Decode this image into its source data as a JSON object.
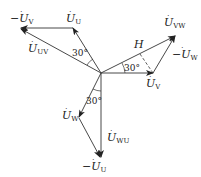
{
  "diagram": {
    "type": "phasor",
    "origin": [
      101,
      73
    ],
    "vectors": [
      {
        "id": "U_U",
        "label": "U",
        "sub": "U",
        "neg": false,
        "from": [
          101,
          73
        ],
        "to": [
          73,
          28
        ]
      },
      {
        "id": "neg_U_V",
        "label": "U",
        "sub": "V",
        "neg": true,
        "from": [
          73,
          28
        ],
        "to": [
          20,
          28
        ]
      },
      {
        "id": "U_UV",
        "label": "U",
        "sub": "UV",
        "neg": false,
        "from": [
          101,
          73
        ],
        "to": [
          20,
          28
        ]
      },
      {
        "id": "U_V",
        "label": "U",
        "sub": "V",
        "neg": false,
        "from": [
          101,
          73
        ],
        "to": [
          153,
          73
        ]
      },
      {
        "id": "neg_U_W",
        "label": "U",
        "sub": "W",
        "neg": true,
        "from": [
          153,
          73
        ],
        "to": [
          176,
          35
        ]
      },
      {
        "id": "U_VW",
        "label": "U",
        "sub": "VW",
        "neg": false,
        "from": [
          101,
          73
        ],
        "to": [
          176,
          35
        ]
      },
      {
        "id": "U_W",
        "label": "U",
        "sub": "W",
        "neg": false,
        "from": [
          101,
          73
        ],
        "to": [
          78,
          118
        ]
      },
      {
        "id": "neg_U_U",
        "label": "U",
        "sub": "U",
        "neg": true,
        "from": [
          78,
          118
        ],
        "to": [
          101,
          158
        ]
      },
      {
        "id": "U_WU",
        "label": "U",
        "sub": "WU",
        "neg": false,
        "from": [
          101,
          73
        ],
        "to": [
          101,
          158
        ]
      }
    ],
    "labels": {
      "neg_U_V": {
        "prefix": "−",
        "main": "U",
        "sub": "V"
      },
      "U_U": {
        "prefix": "",
        "main": "U",
        "sub": "U"
      },
      "U_UV": {
        "prefix": "",
        "main": "U",
        "sub": "UV"
      },
      "U_VW": {
        "prefix": "",
        "main": "U",
        "sub": "VW"
      },
      "neg_U_W": {
        "prefix": "−",
        "main": "U",
        "sub": "W"
      },
      "U_V": {
        "prefix": "",
        "main": "U",
        "sub": "V"
      },
      "U_W": {
        "prefix": "",
        "main": "U",
        "sub": "W"
      },
      "U_WU": {
        "prefix": "",
        "main": "U",
        "sub": "WU"
      },
      "neg_U_U": {
        "prefix": "−",
        "main": "U",
        "sub": "U"
      },
      "H": "H"
    },
    "angles": {
      "a1": "30°",
      "a2": "30°",
      "a3": "30°"
    }
  }
}
